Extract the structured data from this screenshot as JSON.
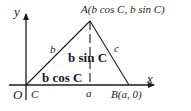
{
  "diagram": {
    "type": "triangle-in-coordinate-plane",
    "axes": {
      "x_label": "x",
      "y_label": "y",
      "origin_label": "O"
    },
    "vertices": {
      "A": {
        "label": "A(b cos C, b sin C)"
      },
      "B": {
        "label": "B(a, 0)"
      },
      "C": {
        "label": "C"
      }
    },
    "sides": {
      "b": "b",
      "c": "c",
      "a": "a"
    },
    "segments": {
      "height": "b sin C",
      "projection": "b cos C"
    },
    "colors": {
      "stroke": "#1a1a1a",
      "background": "#ffffff"
    }
  }
}
